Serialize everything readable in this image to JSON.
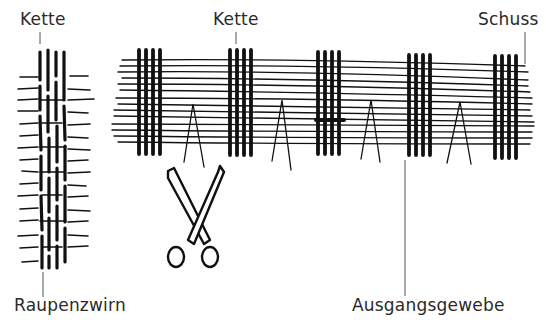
{
  "diagram": {
    "type": "textile weaving illustration",
    "labels": {
      "kette_left": "Kette",
      "kette_center": "Kette",
      "schuss": "Schuss",
      "raupenzwirn": "Raupenzwirn",
      "ausgangsgewebe": "Ausgangsgewebe"
    },
    "components": {
      "chenille_yarn": {
        "name": "Raupenzwirn",
        "warp_threads": 4,
        "cut_weft_fringes": true
      },
      "base_fabric": {
        "name": "Ausgangsgewebe",
        "warp_groups": 5,
        "threads_per_group": 4,
        "weft_lines": 14,
        "cut_marks": 4
      },
      "scissors_icon": "scissors"
    },
    "colors": {
      "ink": "#111111",
      "label_text": "#2a2a2a",
      "leader_line": "#555555",
      "background": "#ffffff"
    }
  }
}
